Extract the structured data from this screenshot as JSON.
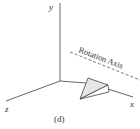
{
  "figure": {
    "caption": "(d)",
    "axes": {
      "x_label": "x",
      "y_label": "y",
      "z_label": "z"
    },
    "rotation_axis": {
      "label": "Rotation Axis",
      "style": "dashed"
    },
    "shape": {
      "type": "triangular-prism-wedge",
      "fill": "#e6e6e6"
    },
    "colors": {
      "line": "#555555",
      "text": "#333333"
    }
  }
}
